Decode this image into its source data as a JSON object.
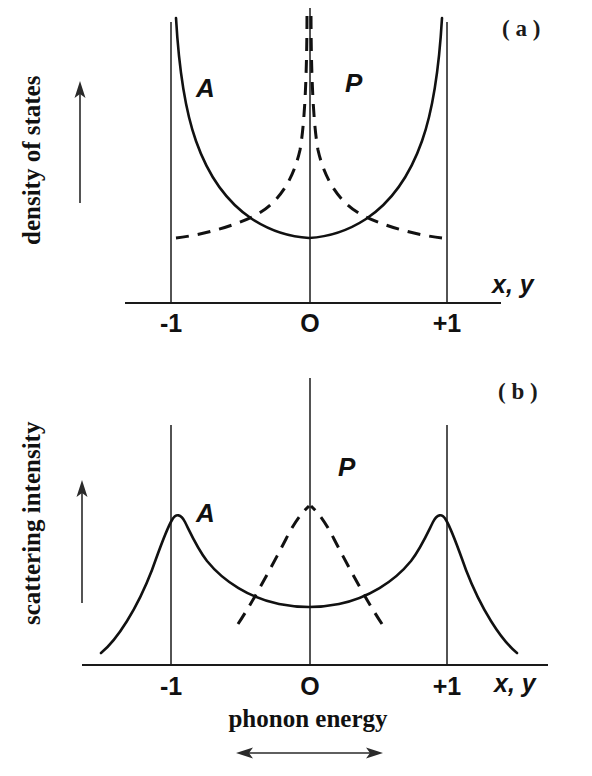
{
  "figure": {
    "panels": [
      {
        "tag": "( a )",
        "ylabel": "density of states",
        "xlabel_var": "x, y",
        "xlabel_caption": "",
        "ticks": [
          {
            "label": "-1",
            "value": -1
          },
          {
            "label": "O",
            "value": 0
          },
          {
            "label": "+1",
            "value": 1
          }
        ],
        "curve_labels": [
          {
            "text": "A",
            "style": "solid"
          },
          {
            "text": "P",
            "style": "dashed"
          }
        ]
      },
      {
        "tag": "( b )",
        "ylabel": "scattering intensity",
        "xlabel_var": "x, y",
        "xlabel_caption": "phonon energy",
        "ticks": [
          {
            "label": "-1",
            "value": -1
          },
          {
            "label": "O",
            "value": 0
          },
          {
            "label": "+1",
            "value": 1
          }
        ],
        "curve_labels": [
          {
            "text": "A",
            "style": "solid"
          },
          {
            "text": "P",
            "style": "dashed"
          }
        ]
      }
    ],
    "colors": {
      "ink": "#111111",
      "axis": "#1a1a1a",
      "background": "#ffffff"
    }
  },
  "chart_data": [
    {
      "type": "line",
      "title": "( a ) density of states",
      "xlabel": "x, y",
      "ylabel": "density of states",
      "xlim": [
        -1.35,
        1.35
      ],
      "ylim": [
        0,
        1
      ],
      "xticks": [
        -1,
        0,
        1
      ],
      "xticklabels": [
        "-1",
        "O",
        "+1"
      ],
      "yticks": [],
      "grid": false,
      "legend": "inline-annotation",
      "vertical_markers": [
        -1,
        0,
        1
      ],
      "series": [
        {
          "name": "A",
          "label": "A",
          "style": "solid",
          "description": "acoustic branch van Hove density of states: diverges at x = -1 and x = +1, shallow minimum at x = 0",
          "x": [
            -0.985,
            -0.97,
            -0.95,
            -0.92,
            -0.88,
            -0.83,
            -0.77,
            -0.7,
            -0.62,
            -0.53,
            -0.43,
            -0.32,
            -0.2,
            -0.1,
            0.0,
            0.1,
            0.2,
            0.32,
            0.43,
            0.53,
            0.62,
            0.7,
            0.77,
            0.83,
            0.88,
            0.92,
            0.95,
            0.97,
            0.985
          ],
          "y": [
            1.0,
            0.9,
            0.78,
            0.66,
            0.56,
            0.47,
            0.4,
            0.345,
            0.3,
            0.265,
            0.235,
            0.212,
            0.196,
            0.189,
            0.186,
            0.189,
            0.196,
            0.212,
            0.235,
            0.265,
            0.3,
            0.345,
            0.4,
            0.47,
            0.56,
            0.66,
            0.78,
            0.9,
            1.0
          ]
        },
        {
          "name": "P",
          "label": "P",
          "style": "dashed",
          "description": "optic branch density of states: diverges at x = 0, falls off toward x = -1 and x = +1",
          "x": [
            -0.97,
            -0.9,
            -0.82,
            -0.73,
            -0.63,
            -0.53,
            -0.43,
            -0.34,
            -0.26,
            -0.19,
            -0.13,
            -0.08,
            -0.04,
            -0.015,
            0.015,
            0.04,
            0.08,
            0.13,
            0.19,
            0.26,
            0.34,
            0.43,
            0.53,
            0.63,
            0.73,
            0.82,
            0.9,
            0.97
          ],
          "y": [
            0.187,
            0.196,
            0.21,
            0.23,
            0.258,
            0.295,
            0.345,
            0.405,
            0.475,
            0.555,
            0.645,
            0.745,
            0.86,
            0.96,
            0.96,
            0.86,
            0.745,
            0.645,
            0.555,
            0.475,
            0.405,
            0.345,
            0.295,
            0.258,
            0.23,
            0.21,
            0.196,
            0.187
          ]
        }
      ]
    },
    {
      "type": "line",
      "title": "( b ) scattering intensity",
      "xlabel": "x, y",
      "ylabel": "scattering intensity",
      "xlabel_caption": "phonon energy",
      "xlim": [
        -1.35,
        1.35
      ],
      "ylim": [
        0,
        1
      ],
      "xticks": [
        -1,
        0,
        1
      ],
      "xticklabels": [
        "-1",
        "O",
        "+1"
      ],
      "yticks": [],
      "grid": false,
      "legend": "inline-annotation",
      "vertical_markers": [
        -1,
        0,
        1
      ],
      "series": [
        {
          "name": "A",
          "label": "A",
          "style": "solid",
          "description": "acoustic scattering intensity: broadened van Hove peaks just inside x = -1 and x = +1, broad minimum at x = 0, tails decaying outside the zone boundaries",
          "x": [
            -1.3,
            -1.22,
            -1.14,
            -1.08,
            -1.03,
            -1.0,
            -0.965,
            -0.93,
            -0.88,
            -0.8,
            -0.7,
            -0.58,
            -0.45,
            -0.3,
            -0.15,
            0.0,
            0.15,
            0.3,
            0.45,
            0.58,
            0.7,
            0.8,
            0.88,
            0.93,
            0.965,
            1.0,
            1.03,
            1.08,
            1.14,
            1.22,
            1.3
          ],
          "y": [
            0.055,
            0.105,
            0.185,
            0.29,
            0.43,
            0.53,
            0.64,
            0.7,
            0.672,
            0.612,
            0.54,
            0.465,
            0.405,
            0.352,
            0.325,
            0.318,
            0.325,
            0.352,
            0.405,
            0.465,
            0.54,
            0.612,
            0.672,
            0.7,
            0.64,
            0.53,
            0.43,
            0.29,
            0.185,
            0.105,
            0.055
          ]
        },
        {
          "name": "P",
          "label": "P",
          "style": "dashed",
          "description": "optic scattering intensity: single broadened peak centred at x = 0, truncated near x = +/-0.52",
          "x": [
            -0.52,
            -0.46,
            -0.4,
            -0.34,
            -0.28,
            -0.22,
            -0.16,
            -0.11,
            -0.06,
            -0.025,
            0.0,
            0.025,
            0.06,
            0.11,
            0.16,
            0.22,
            0.28,
            0.34,
            0.4,
            0.46,
            0.52
          ],
          "y": [
            0.245,
            0.305,
            0.37,
            0.44,
            0.515,
            0.595,
            0.68,
            0.755,
            0.818,
            0.85,
            0.858,
            0.85,
            0.818,
            0.755,
            0.68,
            0.595,
            0.515,
            0.44,
            0.37,
            0.305,
            0.245
          ]
        }
      ]
    }
  ]
}
